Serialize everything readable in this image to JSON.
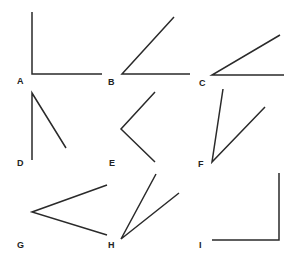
{
  "figure": {
    "stroke_color": "#2a2a2a",
    "label_color": "#222222",
    "background": "#ffffff",
    "angles": [
      {
        "label": "A",
        "label_pos": [
          17,
          84
        ],
        "vertex": [
          32,
          74
        ],
        "arm1": [
          32,
          12
        ],
        "arm2": [
          102,
          74
        ]
      },
      {
        "label": "B",
        "label_pos": [
          108,
          85
        ],
        "vertex": [
          122,
          74
        ],
        "arm1": [
          174,
          17
        ],
        "arm2": [
          190,
          74
        ]
      },
      {
        "label": "C",
        "label_pos": [
          199,
          86
        ],
        "vertex": [
          212,
          75
        ],
        "arm1": [
          280,
          35
        ],
        "arm2": [
          284,
          75
        ]
      },
      {
        "label": "D",
        "label_pos": [
          17,
          166
        ],
        "vertex": [
          32,
          93
        ],
        "arm1": [
          32,
          160
        ],
        "arm2": [
          66,
          148
        ]
      },
      {
        "label": "E",
        "label_pos": [
          109,
          166
        ],
        "vertex": [
          121,
          129
        ],
        "arm1": [
          155,
          92
        ],
        "arm2": [
          155,
          162
        ]
      },
      {
        "label": "F",
        "label_pos": [
          198,
          167
        ],
        "vertex": [
          212,
          162
        ],
        "arm1": [
          223,
          89
        ],
        "arm2": [
          265,
          107
        ]
      },
      {
        "label": "G",
        "label_pos": [
          17,
          248
        ],
        "vertex": [
          32,
          212
        ],
        "arm1": [
          107,
          185
        ],
        "arm2": [
          107,
          235
        ]
      },
      {
        "label": "H",
        "label_pos": [
          108,
          248
        ],
        "vertex": [
          121,
          239
        ],
        "arm1": [
          156,
          174
        ],
        "arm2": [
          179,
          193
        ]
      },
      {
        "label": "I",
        "label_pos": [
          199,
          248
        ],
        "vertex": [
          279,
          240
        ],
        "arm1": [
          279,
          173
        ],
        "arm2": [
          212,
          240
        ]
      }
    ]
  }
}
